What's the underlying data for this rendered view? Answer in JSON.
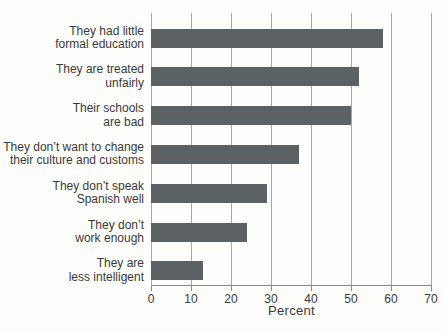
{
  "chart_data": {
    "type": "bar",
    "orientation": "horizontal",
    "title": "",
    "categories": [
      [
        "They had little",
        "formal education"
      ],
      [
        "They are treated",
        "unfairly"
      ],
      [
        "Their schools",
        "are bad"
      ],
      [
        "They don’t want to change",
        "their culture and customs"
      ],
      [
        "They don’t speak",
        "Spanish well"
      ],
      [
        "They don’t",
        "work enough"
      ],
      [
        "They are",
        "less intelligent"
      ]
    ],
    "values": [
      58,
      52,
      50,
      37,
      29,
      24,
      13
    ],
    "xlabel": "Percent",
    "xlim": [
      0,
      70
    ],
    "xticks": [
      0,
      10,
      20,
      30,
      40,
      50,
      60,
      70
    ],
    "grid": "vertical-gridlines",
    "legend": "none",
    "colors": {
      "bar": "#5c6164",
      "gridline": "#a6a6a6",
      "axis": "#8a8a8a",
      "text": "#3a3a3a",
      "background": "#fdfdfb"
    }
  }
}
